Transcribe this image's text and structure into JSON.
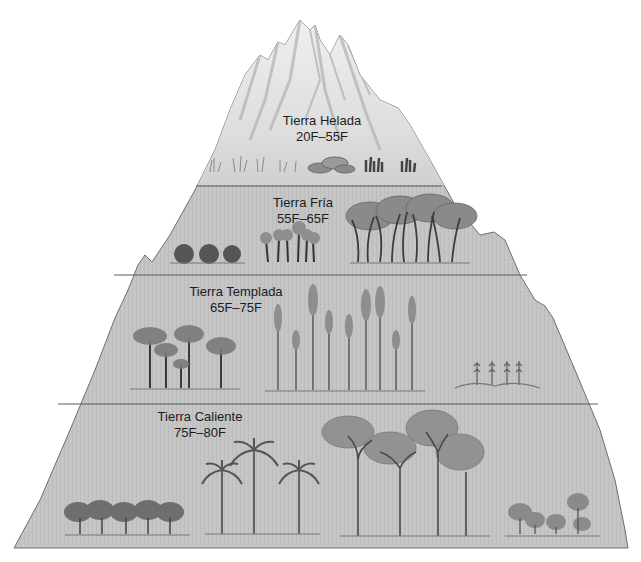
{
  "diagram": {
    "type": "vertical-climate-zones",
    "colors": {
      "background": "#ffffff",
      "mountain_fill": "#c4c4c4",
      "snow_cap": "#e6e6e6",
      "zone_divider": "#5a5a5a",
      "outline": "#6e6e6e",
      "label_text": "#1c1c1c",
      "vegetation": "#5e5e5e"
    },
    "zones": [
      {
        "name": "Tierra Helada",
        "range": "20F–55F",
        "vegetation": [
          "grasses",
          "lichen-covered rocks",
          "low dark shrubs"
        ]
      },
      {
        "name": "Tierra Fría",
        "range": "55F–65F",
        "vegetation": [
          "round shrubs",
          "dwarf palm-like plants",
          "twisted woodland trees"
        ]
      },
      {
        "name": "Tierra Templada",
        "range": "65F–75F",
        "vegetation": [
          "umbrella-crowned trees",
          "tall slender conifers",
          "corn plants"
        ]
      },
      {
        "name": "Tierra Caliente",
        "range": "75F–80F",
        "vegetation": [
          "cacao trees",
          "palm trees",
          "tall canopy rainforest trees",
          "banana plants"
        ]
      }
    ]
  }
}
